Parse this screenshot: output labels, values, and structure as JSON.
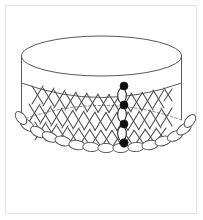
{
  "figure": {
    "title": "Netted beadwork cylinder diagram",
    "background_color": "#ffffff",
    "frame_color": "#e3e3e3",
    "line_color": "#5a5a5a",
    "net_color": "#4a4a4a",
    "bead_outline_color": "#555555",
    "highlight_color": "#111111"
  },
  "geometry": {
    "page": {
      "width": 203,
      "height": 220
    },
    "frame": {
      "x": 5,
      "y": 5,
      "width": 192,
      "height": 209
    },
    "rim_ellipse": {
      "cx": 101.5,
      "cy": 56,
      "rx": 80,
      "ry": 20
    },
    "side_left": {
      "x": 21.5,
      "y_top": 56,
      "y_bottom": 120
    },
    "side_right": {
      "x": 181.5,
      "y_top": 56,
      "y_bottom": 120
    },
    "band_front_curve": "M21.5,83 Q101.5,112 181.5,83",
    "band_hidden_curve": "M21.5,120 Q101.5,91 181.5,120",
    "hem_front_curve": "M21.5,120 Q101.5,156 181.5,120",
    "net_rows": 3,
    "net_columns": 14,
    "net_cell_width": 11.4,
    "net_row_height": 18,
    "hem_bead_count": 15,
    "hem_bead_rx": 8.2,
    "hem_bead_ry": 4.6,
    "thread_column_x": 124,
    "thread_top_y": 86,
    "thread_bottom_y": 143
  },
  "thread_path": {
    "label": "highlighted thread path",
    "solid_bead_count": 4,
    "outlined_bead_count": 3,
    "solid_beads": [
      {
        "cx": 124,
        "cy": 86,
        "r": 4.0
      },
      {
        "cx": 124,
        "cy": 105,
        "r": 4.0
      },
      {
        "cx": 124,
        "cy": 124,
        "r": 4.0
      },
      {
        "cx": 124,
        "cy": 143,
        "r": 4.2
      }
    ],
    "outlined_beads": [
      {
        "cx": 122,
        "cy": 95.5,
        "rx": 4.3,
        "ry": 7.4
      },
      {
        "cx": 122,
        "cy": 114.5,
        "rx": 4.3,
        "ry": 7.4
      },
      {
        "cx": 122,
        "cy": 133.5,
        "rx": 4.3,
        "ry": 7.4
      }
    ]
  }
}
